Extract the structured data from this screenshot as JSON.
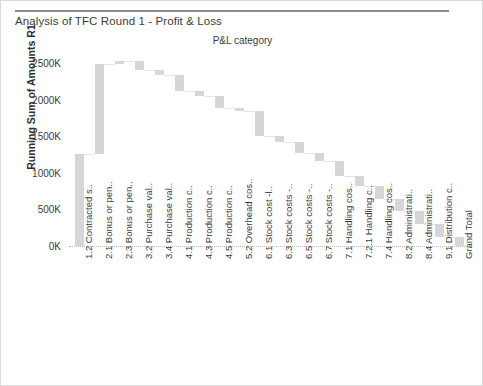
{
  "chart": {
    "title": "Analysis of TFC Round 1 - Profit & Loss",
    "legend_title": "P&L category",
    "ylabel": "Running Sum of Amounts R1"
  },
  "chart_data": {
    "type": "bar",
    "subtype": "waterfall",
    "title": "Analysis of TFC Round 1 - Profit & Loss",
    "legend_title": "P&L category",
    "xlabel": "",
    "ylabel": "Running Sum of Amounts R1",
    "ylim": [
      0,
      2750
    ],
    "yticks": [
      0,
      500,
      1000,
      1500,
      2000,
      2500
    ],
    "ytick_labels": [
      "0K",
      "500K",
      "1000K",
      "1500K",
      "2000K",
      "2500K"
    ],
    "grid": false,
    "bar_color": "#d6d6d6",
    "units": "K",
    "categories": [
      "1.2 Contracted s..",
      "2.1 Bonus or pen..",
      "2.3 Bonus or pen..",
      "3.2 Purchase val..",
      "3.4 Purchase val..",
      "4.1 Production c..",
      "4.3 Production c..",
      "4.5 Production c..",
      "5.2 Overhead cos..",
      "6.1 Stock cost -l..",
      "6.3 Stock costs -..",
      "6.5 Stock costs -..",
      "6.7 Stock costs -..",
      "7.1 Handling cos..",
      "7.2.1 Handling c..",
      "7.4 Handling cos..",
      "8.2 Administrati..",
      "8.4 Administrati..",
      "9.1 Distribution c..",
      "Grand Total"
    ],
    "running_start": [
      0,
      1255,
      2480,
      2530,
      2400,
      2340,
      2120,
      2050,
      1880,
      1840,
      1500,
      1420,
      1270,
      1160,
      950,
      820,
      640,
      480,
      300,
      0
    ],
    "running_end": [
      1255,
      2480,
      2530,
      2400,
      2340,
      2120,
      2050,
      1880,
      1840,
      1500,
      1420,
      1270,
      1160,
      950,
      820,
      640,
      480,
      300,
      120,
      120
    ],
    "values": [
      1255,
      1225,
      50,
      -130,
      -60,
      -220,
      -70,
      -170,
      -40,
      -340,
      -80,
      -150,
      -110,
      -210,
      -130,
      -180,
      -160,
      -180,
      -180,
      120
    ],
    "is_total": [
      false,
      false,
      false,
      false,
      false,
      false,
      false,
      false,
      false,
      false,
      false,
      false,
      false,
      false,
      false,
      false,
      false,
      false,
      false,
      true
    ]
  }
}
